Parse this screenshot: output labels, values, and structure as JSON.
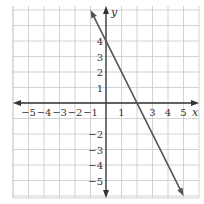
{
  "chart_data": {
    "type": "line",
    "title": "",
    "xlabel": "x",
    "ylabel": "y",
    "xlim": [
      -6,
      6
    ],
    "ylim": [
      -6,
      6
    ],
    "grid": true,
    "x_ticks": [
      "−5",
      "−4",
      "−3",
      "−2",
      "−1",
      "1",
      "3",
      "4",
      "5"
    ],
    "x_tick_values": [
      -5,
      -4,
      -3,
      -2,
      -1,
      1,
      3,
      4,
      5
    ],
    "y_ticks": [
      "4",
      "3",
      "2",
      "1",
      "−2",
      "−3",
      "−4",
      "−5"
    ],
    "y_tick_values": [
      4,
      3,
      2,
      1,
      -2,
      -3,
      -4,
      -5
    ],
    "series": [
      {
        "name": "y = -2x + 4",
        "equation": "y = -2x + 4",
        "x": [
          -1,
          5
        ],
        "y": [
          6,
          -6
        ],
        "color": "#555555",
        "arrows": "both"
      }
    ],
    "colors": {
      "grid": "#c8c8c8",
      "axis": "#333333",
      "line": "#555555"
    }
  }
}
